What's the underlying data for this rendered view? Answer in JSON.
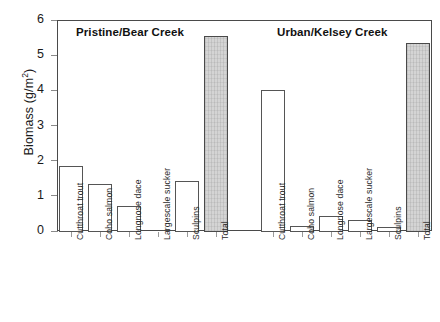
{
  "chart_data": {
    "type": "bar",
    "title": "",
    "xlabel": "",
    "ylabel": "Biomass (g/m2)",
    "ylabel_display": "Biomass (g/m",
    "ylabel_exponent": "2",
    "ylabel_suffix": ")",
    "ylim": [
      0,
      6
    ],
    "yticks": [
      0,
      1,
      2,
      3,
      4,
      5,
      6
    ],
    "ytick_labels": [
      "0",
      "1",
      "2",
      "3",
      "4",
      "5",
      "6"
    ],
    "grid": false,
    "legend": false,
    "categories": [
      "Cutthroat trout",
      "Coho salmon",
      "Longnose dace",
      "Largescale sucker",
      "Sculpins",
      "Total"
    ],
    "panels": [
      {
        "name": "Pristine/Bear Creek",
        "title": "Pristine/Bear Creek",
        "values": [
          1.85,
          1.35,
          0.72,
          0.0,
          1.42,
          5.55
        ],
        "categories": [
          "Cutthroat trout",
          "Coho salmon",
          "Longnose dace",
          "Largescale sucker",
          "Sculpins",
          "Total"
        ]
      },
      {
        "name": "Urban/Kelsey Creek",
        "title": "Urban/Kelsey Creek",
        "values": [
          4.02,
          0.14,
          0.42,
          0.3,
          0.12,
          5.35
        ],
        "categories": [
          "Cutthroat trout",
          "Coho salmon",
          "Longnose dace",
          "Largescale sucker",
          "Sculpins",
          "Total"
        ]
      }
    ],
    "series": [
      {
        "name": "Pristine/Bear Creek",
        "values": [
          1.85,
          1.35,
          0.72,
          0.0,
          1.42,
          5.55
        ]
      },
      {
        "name": "Urban/Kelsey Creek",
        "values": [
          4.02,
          0.14,
          0.42,
          0.3,
          0.12,
          5.35
        ]
      }
    ],
    "colors": {
      "bar_fill": "#ffffff",
      "bar_edge": "#555555",
      "total_fill": "#d4d4d4",
      "axis": "#4a4a4a",
      "text": "#1a1a1a"
    }
  },
  "axis_geometry": {
    "plot_left": 57,
    "plot_top": 20,
    "plot_width": 375,
    "plot_height": 211
  }
}
